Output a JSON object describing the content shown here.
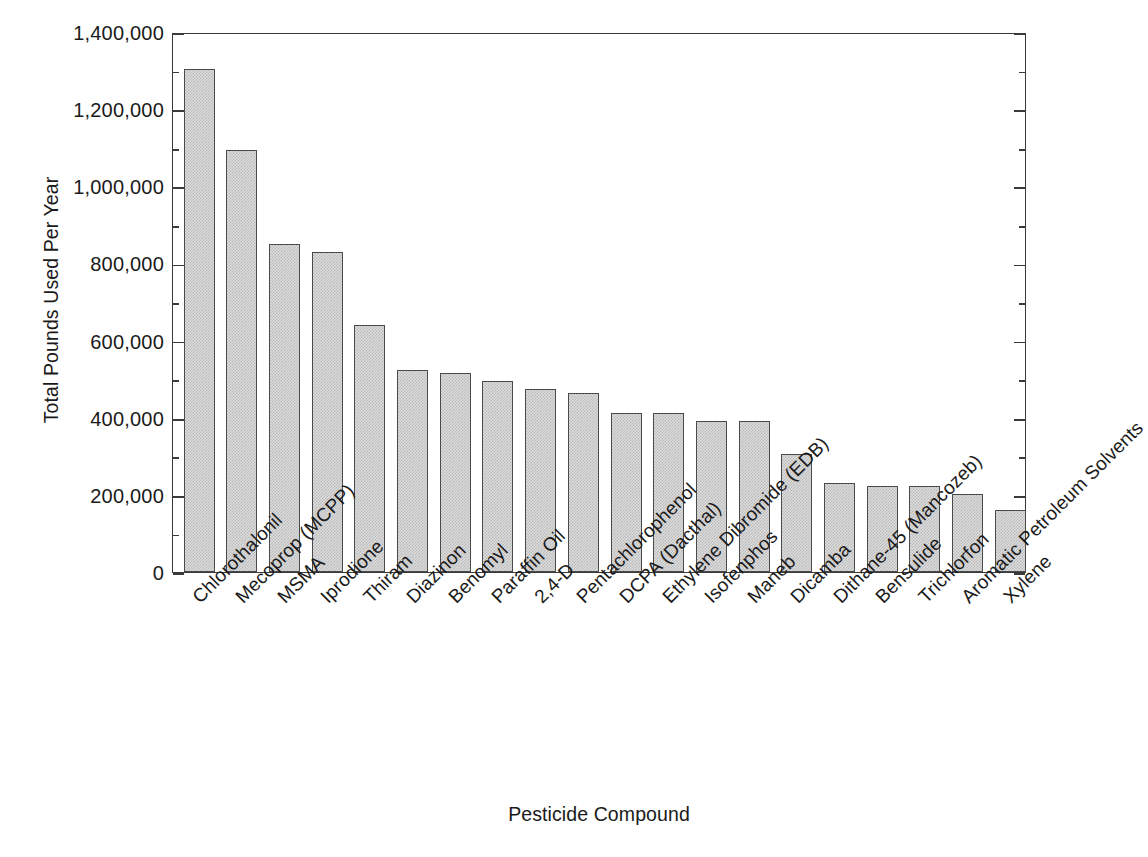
{
  "chart_data": {
    "type": "bar",
    "title": "",
    "subtitle": "",
    "xlabel": "Pesticide Compound",
    "ylabel": "Total Pounds Used Per Year",
    "ylim": [
      0,
      1400000
    ],
    "ytick_step": 200000,
    "yminor_step": 100000,
    "grid": false,
    "legend": null,
    "orientation": "vertical",
    "bar_style": {
      "fill": "#dcdcdc",
      "pattern": "checkered-dither",
      "border": "#4a4a4a"
    },
    "ytick_labels": [
      "0",
      "200,000",
      "400,000",
      "600,000",
      "800,000",
      "1,000,000",
      "1,200,000",
      "1,400,000"
    ],
    "ytick_values": [
      0,
      200000,
      400000,
      600000,
      800000,
      1000000,
      1200000,
      1400000
    ],
    "categories": [
      "Chlorothalonil",
      "Mecoprop (MCPP)",
      "MSMA",
      "Iprodione",
      "Thiram",
      "Diazinon",
      "Benomyl",
      "Paraffin Oil",
      "2,4-D",
      "Pentachlorophenol",
      "DCPA (Dacthal)",
      "Ethylene Dibromide (EDB)",
      "Isofenphos",
      "Maneb",
      "Dicamba",
      "Dithane-45 (Mancozeb)",
      "Bensulide",
      "Trichlorfon",
      "Aromatic Petroleum Solvents",
      "Xylene"
    ],
    "values": [
      1305000,
      1095000,
      850000,
      830000,
      640000,
      525000,
      515000,
      495000,
      475000,
      465000,
      412000,
      412000,
      392000,
      392000,
      305000,
      232000,
      222000,
      222000,
      203000,
      160000
    ]
  }
}
